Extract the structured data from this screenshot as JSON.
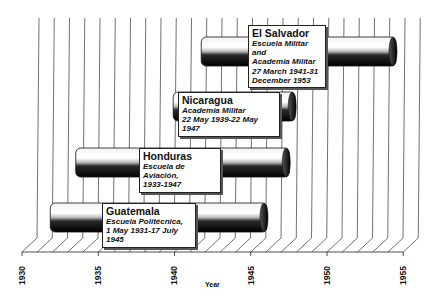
{
  "chart_data": {
    "type": "bar",
    "orientation": "horizontal-gantt-3d",
    "title": "",
    "xlabel": "Year",
    "ylabel": "",
    "xlim": [
      1930,
      1955
    ],
    "x_ticks": [
      "1930",
      "1935",
      "1940",
      "1945",
      "1950",
      "1955"
    ],
    "grid": true,
    "legend": null,
    "series": [
      {
        "name": "Guatemala",
        "institution": "Escuela Politécnica,",
        "dates": "1 May 1931-17 July 1945",
        "start": 1931.33,
        "end": 1945.54
      },
      {
        "name": "Honduras",
        "institution": "Escuela de Aviación,",
        "dates": "1933-1947",
        "start": 1933,
        "end": 1947
      },
      {
        "name": "Nicaragua",
        "institution": "Academia Militar",
        "dates": "22 May 1939-22 May 1947",
        "start": 1939.39,
        "end": 1947.39
      },
      {
        "name": "El Salvador",
        "institution": "Escuela Militar and Academia Militar",
        "dates": "27 March 1941-31 December 1953",
        "start": 1941.23,
        "end": 1954.0
      }
    ]
  },
  "labels": {
    "guatemala": {
      "title": "Guatemala",
      "line1": "Escuela Politécnica,",
      "line2": "1 May 1931-17 July 1945"
    },
    "honduras": {
      "title": "Honduras",
      "line1": "Escuela de Aviación,",
      "line2": "1933-1947"
    },
    "nicaragua": {
      "title": "Nicaragua",
      "line1": "Academia Militar",
      "line2": "22 May 1939-22 May 1947"
    },
    "elsalvador": {
      "title": "El Salvador",
      "line1": "Escuela Militar and",
      "line2": "Academia Militar",
      "line3": "27 March 1941-31",
      "line4": "December 1953"
    }
  },
  "axis": {
    "title": "Year",
    "ticks": [
      "1930",
      "1935",
      "1940",
      "1945",
      "1950",
      "1955"
    ]
  }
}
